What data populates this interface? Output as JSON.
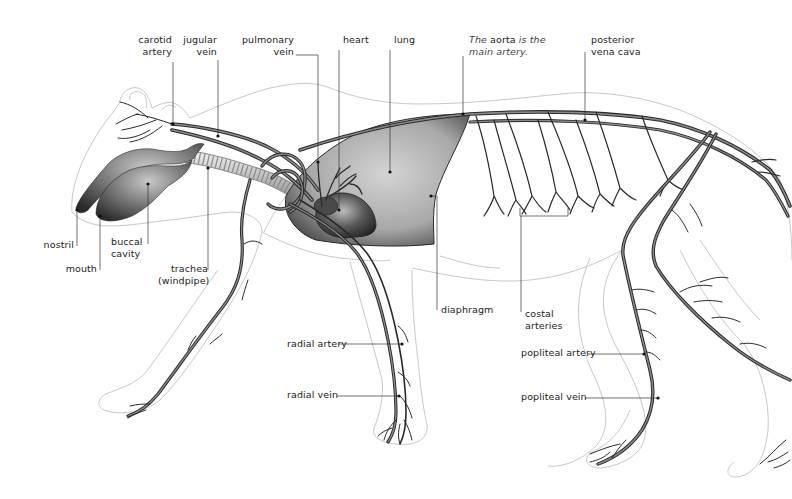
{
  "diagram": {
    "colors": {
      "outline": "#c8c8c8",
      "vessel_dark": "#2a2a2a",
      "vessel_mid": "#7a7a7a",
      "lung_fill": "#9a9a9a",
      "leader": "#333333",
      "text": "#222222"
    }
  },
  "labels": {
    "carotid_artery": [
      "carotid",
      "artery"
    ],
    "jugular_vein": [
      "jugular",
      "vein"
    ],
    "pulmonary_vein": [
      "pulmonary",
      "vein"
    ],
    "heart": "heart",
    "lung": "lung",
    "aorta_note": {
      "prefix": "The",
      "keyword": "aorta",
      "rest1": "is the",
      "line2": "main artery."
    },
    "posterior_vena_cava": [
      "posterior",
      "vena cava"
    ],
    "nostril": "nostril",
    "mouth": "mouth",
    "buccal_cavity": [
      "buccal",
      "cavity"
    ],
    "trachea": [
      "trachea",
      "(windpipe)"
    ],
    "diaphragm": "diaphragm",
    "costal_arteries": [
      "costal",
      "arteries"
    ],
    "radial_artery": "radial artery",
    "radial_vein": "radial vein",
    "popliteal_artery": "popliteal artery",
    "popliteal_vein": "popliteal vein"
  }
}
